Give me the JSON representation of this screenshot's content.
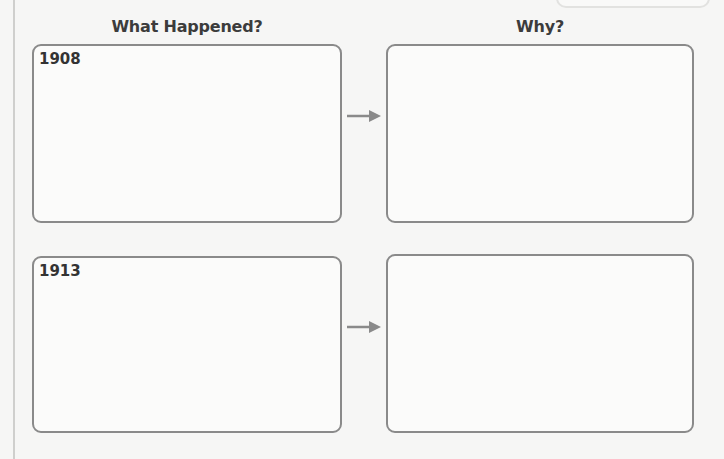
{
  "worksheet": {
    "columns": {
      "left_header": "What Happened?",
      "right_header": "Why?"
    },
    "rows": [
      {
        "what_label": "1908",
        "what_text": "",
        "why_text": ""
      },
      {
        "what_label": "1913",
        "what_text": "",
        "why_text": ""
      }
    ],
    "icons": {
      "arrow": "arrow-right-icon"
    },
    "colors": {
      "background": "#f6f6f5",
      "box_border": "#8a8a8a",
      "arrow": "#8a8a8a",
      "text": "#3a3a3a"
    }
  }
}
